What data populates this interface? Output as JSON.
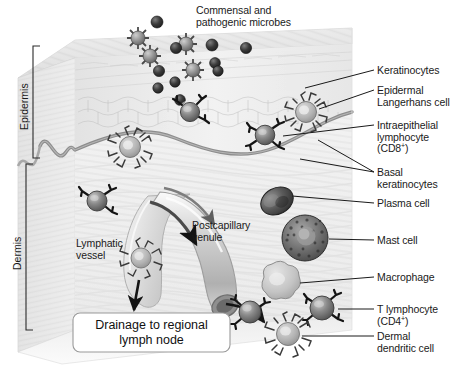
{
  "figure": {
    "title_annotation": "Commensal and\npathogenic microbes",
    "region_labels": [
      {
        "id": "epidermis",
        "text": "Epidermis"
      },
      {
        "id": "dermis",
        "text": "Dermis"
      }
    ],
    "callout_box": {
      "line1": "Drainage to regional",
      "line2": "lymph node"
    },
    "inline_labels": [
      {
        "id": "lymphatic-vessel",
        "line1": "Lymphatic",
        "line2": "vessel"
      },
      {
        "id": "postcapillary-venule",
        "line1": "Postcapillary",
        "line2": "venule"
      }
    ],
    "right_labels": [
      {
        "id": "keratinocytes",
        "lines": [
          "Keratinocytes"
        ]
      },
      {
        "id": "epidermal-langerhans-cell",
        "lines": [
          "Epidermal",
          "Langerhans cell"
        ]
      },
      {
        "id": "intraepithelial-lymphocyte-cd8",
        "lines": [
          "Intraepithelial",
          "lymphocyte",
          "(CD8+)"
        ]
      },
      {
        "id": "basal-keratinocytes",
        "lines": [
          "Basal",
          "keratinocytes"
        ]
      },
      {
        "id": "plasma-cell",
        "lines": [
          "Plasma cell"
        ]
      },
      {
        "id": "mast-cell",
        "lines": [
          "Mast cell"
        ]
      },
      {
        "id": "macrophage",
        "lines": [
          "Macrophage"
        ]
      },
      {
        "id": "t-lymphocyte-cd4",
        "lines": [
          "T lymphocyte",
          "(CD4+)"
        ]
      },
      {
        "id": "dermal-dendritic-cell",
        "lines": [
          "Dermal",
          "dendritic cell"
        ]
      }
    ],
    "colors": {
      "text": "#1a1a1a",
      "leader_line": "#1a1a1a",
      "epidermis_fill": "#e9e9e9",
      "dermis_fill": "#efefef",
      "basement_membrane": "#8d8d8d",
      "microbe_dark": "#2b2b2b",
      "lymphocyte_body": "#7d7d7d",
      "plasma_cell": "#4a4a4a",
      "mast_cell": "#6f6f6f",
      "macrophage": "#c3c3c3",
      "dendritic_cell": "#a8a8a8",
      "vessel": "#bdbdbd",
      "box_border": "#9a9a9a",
      "box_fill": "#ffffff"
    }
  }
}
